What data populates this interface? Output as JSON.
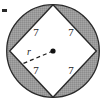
{
  "figure": {
    "type": "circle-with-inscribed-square",
    "colors": {
      "shaded_region": "#9a9a9a",
      "inner_square_fill": "#ffffff",
      "stroke": "#1a1a1a",
      "background": "#ffffff"
    },
    "circle": {
      "center_x": 53,
      "center_y": 51,
      "radius": 47
    },
    "square": {
      "vertex_top": {
        "x": 53,
        "y": 4
      },
      "vertex_right": {
        "x": 96,
        "y": 51
      },
      "vertex_bottom": {
        "x": 53,
        "y": 98
      },
      "vertex_left": {
        "x": 11,
        "y": 51
      }
    },
    "side_labels": [
      {
        "id": "top-left",
        "text": "7",
        "x": 36,
        "y": 33
      },
      {
        "id": "top-right",
        "text": "7",
        "x": 71,
        "y": 33
      },
      {
        "id": "bottom-left",
        "text": "7",
        "x": 36,
        "y": 71
      },
      {
        "id": "bottom-right",
        "text": "7",
        "x": 71,
        "y": 71
      }
    ],
    "radius": {
      "label": "r",
      "label_x": 29,
      "label_y": 53,
      "from": {
        "x": 53,
        "y": 51
      },
      "to": {
        "x": 22,
        "y": 64
      },
      "dash_pattern": "4,3"
    },
    "center_dot": {
      "x": 53,
      "y": 51,
      "size": 2.6
    },
    "corner_mark": {
      "x": 2,
      "y": 9,
      "width": 5,
      "height": 3
    }
  }
}
